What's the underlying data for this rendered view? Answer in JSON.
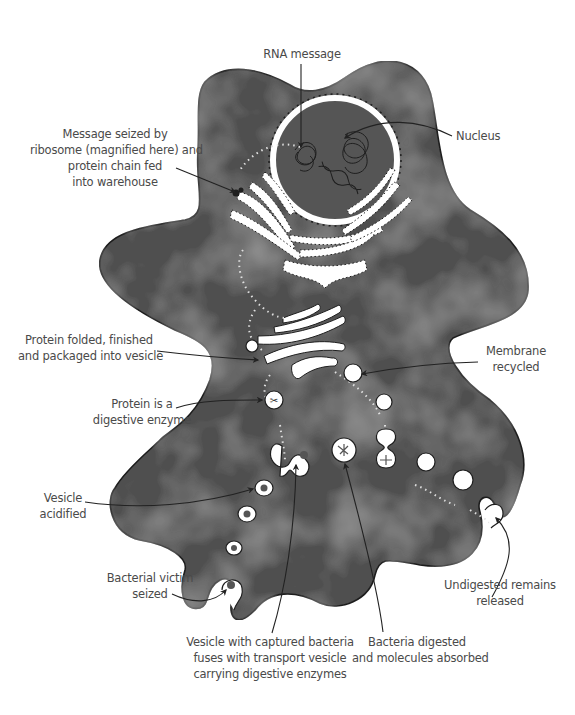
{
  "diagram": {
    "type": "cell-process-illustration",
    "colors": {
      "background": "#ffffff",
      "cell_fill": "#4f4f4f",
      "cell_fill_light": "#5e5e5e",
      "cell_outline": "#1e1e1e",
      "organelle": "#ffffff",
      "label_text": "#4a4a4a",
      "leader_line": "#222222",
      "bacterium": "#4a4a4a"
    },
    "labels": {
      "rna_message": {
        "lines": [
          "RNA message"
        ]
      },
      "nucleus": {
        "lines": [
          "Nucleus"
        ]
      },
      "ribosome": {
        "lines": [
          "Message seized by",
          "ribosome (magnified here) and",
          "protein chain fed",
          "into warehouse"
        ]
      },
      "protein_folded": {
        "lines": [
          "Protein folded, finished",
          "and packaged into vesicle"
        ]
      },
      "membrane_recycled": {
        "lines": [
          "Membrane",
          "recycled"
        ]
      },
      "digestive_enzyme": {
        "lines": [
          "Protein is a",
          "digestive enzyme"
        ]
      },
      "vesicle_acidified": {
        "lines": [
          "Vesicle",
          "acidified"
        ]
      },
      "bacterial_victim": {
        "lines": [
          "Bacterial victim",
          "seized"
        ]
      },
      "vesicle_fuses": {
        "lines": [
          "Vesicle with captured bacteria",
          "fuses with transport vesicle",
          "carrying digestive enzymes"
        ]
      },
      "bacteria_digested": {
        "lines": [
          "Bacteria digested",
          "and molecules absorbed"
        ]
      },
      "undigested_remains": {
        "lines": [
          "Undigested remains",
          "released"
        ]
      }
    }
  }
}
